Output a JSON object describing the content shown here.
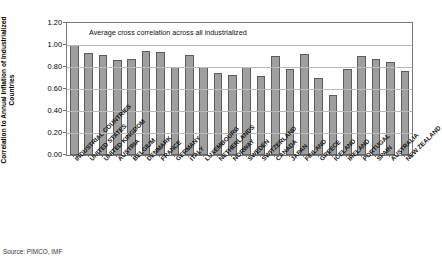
{
  "chart_data": {
    "type": "bar",
    "title": "",
    "annotation": "Average cross correlation across all industrialized",
    "xlabel": "",
    "ylabel": "Correlation to Annual Inflation of Industrialized Countries",
    "ylim": [
      0.0,
      1.2
    ],
    "ytick_labels": [
      "1.20",
      "1.00",
      "0.80",
      "0.60",
      "0.40",
      "0.20",
      "0.00"
    ],
    "ytick_values": [
      1.2,
      1.0,
      0.8,
      0.6,
      0.4,
      0.2,
      0.0
    ],
    "grid": true,
    "legend": "none",
    "bar_color": "#9f9f9f",
    "bar_edge_color": "#5d5d5d",
    "categories": [
      "INDUSTRIAL COUNTRIES",
      "UNITED STATES",
      "UNITED KINGDOM",
      "AUSTRIA",
      "BELGIUM",
      "DENMARK",
      "FRANCE",
      "GERMANY",
      "ITALY",
      "LUXEMBOURG",
      "NETHERLANDS",
      "NORWAY",
      "SWEDEN",
      "SWITZERLAND",
      "CANADA",
      "JAPAN",
      "FINLAND",
      "GREECE",
      "ICELAND",
      "IRELAND",
      "PORTUGAL",
      "SPAIN",
      "AUSTRALIA",
      "NEW ZEALAND"
    ],
    "values": [
      1.0,
      0.93,
      0.91,
      0.86,
      0.87,
      0.95,
      0.94,
      0.8,
      0.91,
      0.8,
      0.75,
      0.73,
      0.8,
      0.72,
      0.9,
      0.78,
      0.92,
      0.7,
      0.55,
      0.78,
      0.9,
      0.87,
      0.85,
      0.76
    ]
  },
  "source": {
    "text": "Source: PIMCO, IMF"
  }
}
